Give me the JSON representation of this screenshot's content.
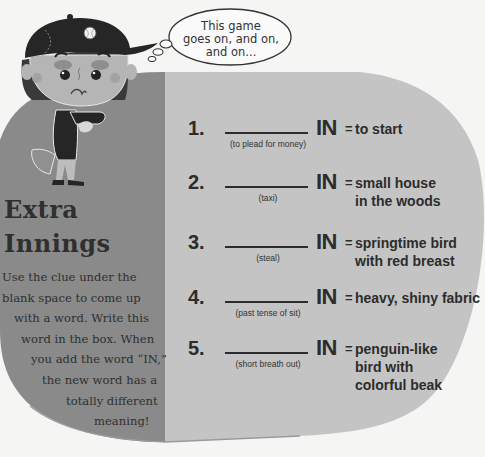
{
  "thought_bubble": {
    "lines": [
      "This game",
      "goes on, and on,",
      "and on..."
    ]
  },
  "title": {
    "line1": "Extra",
    "line2": "Innings"
  },
  "instructions": {
    "lines": [
      "Use the clue under the",
      "blank space to come up",
      "with a word. Write this",
      "word in the box. When",
      "you add the word “IN,”",
      "the new word has a",
      "totally different",
      "meaning!"
    ]
  },
  "puzzle": {
    "suffix": "IN",
    "equals": "=",
    "items": [
      {
        "number": "1.",
        "clue": "(to plead for money)",
        "meaning": [
          "to start"
        ]
      },
      {
        "number": "2.",
        "clue": "(taxi)",
        "meaning": [
          "small house",
          "in the woods"
        ]
      },
      {
        "number": "3.",
        "clue": "(steal)",
        "meaning": [
          "springtime bird",
          "with red breast"
        ]
      },
      {
        "number": "4.",
        "clue": "(past tense of sit)",
        "meaning": [
          "heavy, shiny fabric"
        ]
      },
      {
        "number": "5.",
        "clue": "(short breath out)",
        "meaning": [
          "penguin-like",
          "bird with",
          "colorful beak"
        ]
      }
    ]
  },
  "colors": {
    "page_background": "#f5f5f4",
    "left_panel": "#8a8a8a",
    "right_panel": "#c4c4c4",
    "text": "#2c2c2c"
  },
  "illustration": {
    "subject": "sad-baseball-kid-checking-watch"
  }
}
